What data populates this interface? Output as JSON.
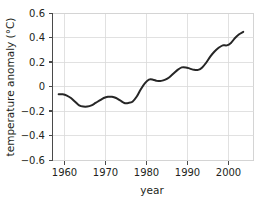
{
  "chart_data": {
    "type": "line",
    "title": "",
    "xlabel": "year",
    "ylabel": "temperature anomaly (°C)",
    "xlim": [
      1956.5,
      2005.5
    ],
    "ylim": [
      -0.6,
      0.6
    ],
    "grid": true,
    "legend": null,
    "xticks": [
      1960,
      1970,
      1980,
      1990,
      2000
    ],
    "xtick_labels": [
      "1960",
      "1970",
      "1980",
      "1990",
      "2000"
    ],
    "yticks": [
      -0.6,
      -0.4,
      -0.2,
      0,
      0.2,
      0.4,
      0.6
    ],
    "ytick_labels": [
      "−0.6",
      "−0.4",
      "−0.2",
      "0",
      "0.2",
      "0.4",
      "0.6"
    ],
    "series": [
      {
        "name": "global temperature anomaly",
        "color": "#262626",
        "x": [
          1958,
          1959,
          1960,
          1961,
          1962,
          1963,
          1964,
          1965,
          1966,
          1967,
          1968,
          1969,
          1970,
          1971,
          1972,
          1973,
          1974,
          1975,
          1976,
          1977,
          1978,
          1979,
          1980,
          1981,
          1982,
          1983,
          1984,
          1985,
          1986,
          1987,
          1988,
          1989,
          1990,
          1991,
          1992,
          1993,
          1994,
          1995,
          1996,
          1997,
          1998,
          1999,
          2000,
          2001,
          2002,
          2003
        ],
        "values": [
          -0.06,
          -0.06,
          -0.07,
          -0.09,
          -0.12,
          -0.15,
          -0.16,
          -0.16,
          -0.15,
          -0.13,
          -0.11,
          -0.09,
          -0.08,
          -0.08,
          -0.09,
          -0.11,
          -0.13,
          -0.13,
          -0.12,
          -0.08,
          -0.02,
          0.03,
          0.06,
          0.06,
          0.05,
          0.05,
          0.06,
          0.08,
          0.11,
          0.14,
          0.16,
          0.16,
          0.15,
          0.14,
          0.14,
          0.16,
          0.2,
          0.25,
          0.29,
          0.32,
          0.34,
          0.34,
          0.36,
          0.4,
          0.43,
          0.45
        ]
      }
    ]
  },
  "axis": {
    "ylabel": "temperature anomaly (°C)",
    "xlabel": "year"
  },
  "ytick_labels": {
    "t0": "0.6",
    "t1": "0.4",
    "t2": "0.2",
    "t3": "0",
    "t4": "−0.2",
    "t5": "−0.4",
    "t6": "−0.6"
  },
  "xtick_labels": {
    "t0": "1960",
    "t1": "1970",
    "t2": "1980",
    "t3": "1990",
    "t4": "2000"
  }
}
